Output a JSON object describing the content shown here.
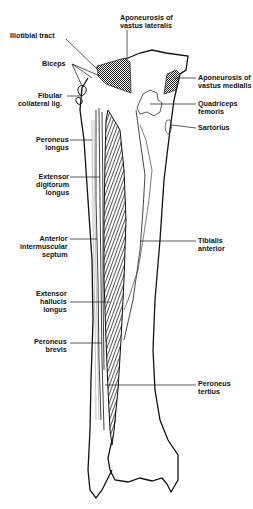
{
  "figure": {
    "colors": {
      "ink": "#111111",
      "background": "#ffffff",
      "stipple": "#222222"
    }
  },
  "labels": {
    "iliotibial_tract": "Iliotibial tract",
    "aponeurosis_vastus_lateralis": "Aponeurosis of\nvastus lateralis",
    "biceps": "Biceps",
    "fibular_collateral_lig": "Fibular\ncollateral lig.",
    "aponeurosis_vastus_medialis": "Aponeurosis of\nvastus medialis",
    "quadriceps_femoris": "Quadriceps\nfemoris",
    "sartorius": "Sartorius",
    "peroneus_longus": "Peroneus\nlongus",
    "extensor_digitorum_longus": "Extensor\ndigitorum\nlongus",
    "anterior_intermuscular_septum": "Anterior\nintermuscular\nseptum",
    "tibialis_anterior": "Tibialis\nanterior",
    "extensor_hallucis_longus": "Extensor\nhallucis\nlongus",
    "peroneus_brevis": "Peroneus\nbrevis",
    "peroneus_tertius": "Peroneus\ntertius"
  }
}
